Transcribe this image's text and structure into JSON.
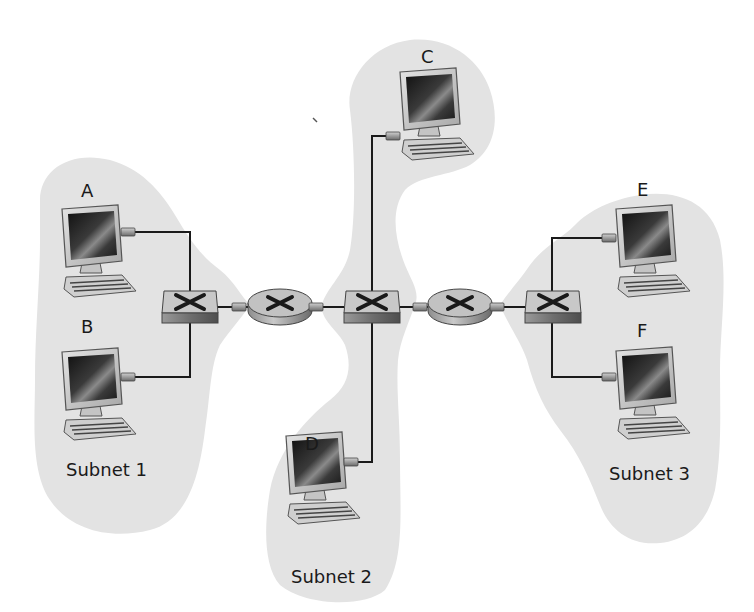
{
  "diagram": {
    "type": "network-topology",
    "colors": {
      "subnet_fill": "#e3e3e3",
      "link": "#1a1a1a",
      "device_body": "#b8b8b8",
      "screen": "#2a2a2a"
    },
    "subnets": [
      {
        "id": "subnet1",
        "label": "Subnet 1",
        "hosts": [
          "A",
          "B"
        ]
      },
      {
        "id": "subnet2",
        "label": "Subnet 2",
        "hosts": [
          "C",
          "D"
        ]
      },
      {
        "id": "subnet3",
        "label": "Subnet 3",
        "hosts": [
          "E",
          "F"
        ]
      }
    ],
    "hosts": [
      {
        "id": "A",
        "label": "A",
        "subnet": "Subnet 1"
      },
      {
        "id": "B",
        "label": "B",
        "subnet": "Subnet 1"
      },
      {
        "id": "C",
        "label": "C",
        "subnet": "Subnet 2"
      },
      {
        "id": "D",
        "label": "D",
        "subnet": "Subnet 2"
      },
      {
        "id": "E",
        "label": "E",
        "subnet": "Subnet 3"
      },
      {
        "id": "F",
        "label": "F",
        "subnet": "Subnet 3"
      }
    ],
    "switches": [
      {
        "id": "switch1",
        "subnet": "Subnet 1"
      },
      {
        "id": "switch2",
        "subnet": "Subnet 2"
      },
      {
        "id": "switch3",
        "subnet": "Subnet 3"
      }
    ],
    "routers": [
      {
        "id": "router1",
        "between": [
          "switch1",
          "switch2"
        ]
      },
      {
        "id": "router2",
        "between": [
          "switch2",
          "switch3"
        ]
      }
    ],
    "links": [
      [
        "A",
        "switch1"
      ],
      [
        "B",
        "switch1"
      ],
      [
        "switch1",
        "router1"
      ],
      [
        "router1",
        "switch2"
      ],
      [
        "C",
        "switch2"
      ],
      [
        "D",
        "switch2"
      ],
      [
        "switch2",
        "router2"
      ],
      [
        "router2",
        "switch3"
      ],
      [
        "E",
        "switch3"
      ],
      [
        "F",
        "switch3"
      ]
    ]
  }
}
